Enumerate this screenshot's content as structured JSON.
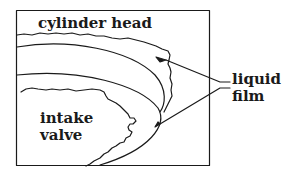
{
  "diagram": {
    "labels": {
      "cylinder_head": "cylinder head",
      "intake_line1": "intake",
      "intake_line2": "valve",
      "liquid": "liquid",
      "film": "film"
    },
    "colors": {
      "stroke": "#1a1a1a",
      "background": "#ffffff"
    }
  }
}
